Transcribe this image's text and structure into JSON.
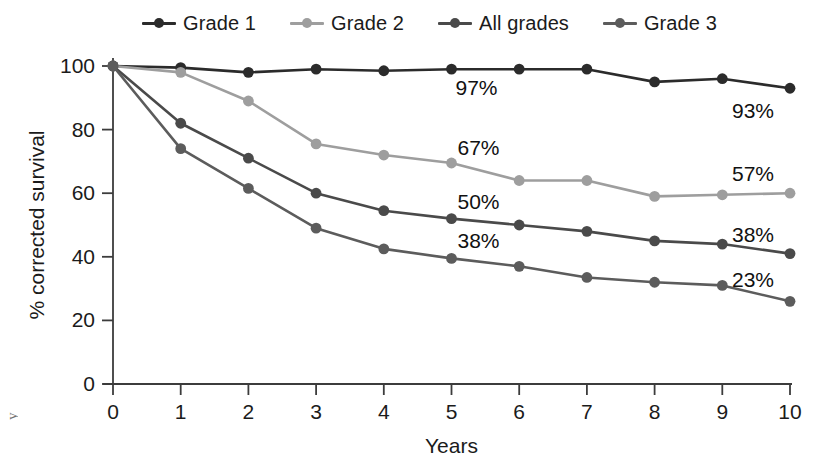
{
  "legend": {
    "position": "top",
    "items": [
      {
        "label": "Grade 1",
        "color": "#2b2b2b"
      },
      {
        "label": "Grade 2",
        "color": "#9e9e9e"
      },
      {
        "label": "All grades",
        "color": "#4a4a4a"
      },
      {
        "label": "Grade 3",
        "color": "#5c5c5c"
      }
    ]
  },
  "axes": {
    "x": {
      "label": "Years",
      "ticks": [
        "0",
        "1",
        "2",
        "3",
        "4",
        "5",
        "6",
        "7",
        "8",
        "9",
        "10"
      ]
    },
    "y": {
      "label": "% corrected survival",
      "ticks": [
        "0",
        "20",
        "40",
        "60",
        "80",
        "100"
      ]
    }
  },
  "edge_fragment": "y",
  "chart_data": {
    "type": "line",
    "title": "",
    "xlabel": "Years",
    "ylabel": "% corrected survival",
    "xlim": [
      0,
      10
    ],
    "ylim": [
      0,
      100
    ],
    "xticks": [
      0,
      1,
      2,
      3,
      4,
      5,
      6,
      7,
      8,
      9,
      10
    ],
    "yticks": [
      0,
      20,
      40,
      60,
      80,
      100
    ],
    "grid": false,
    "legend_position": "top",
    "x": [
      0,
      1,
      2,
      3,
      4,
      5,
      6,
      7,
      8,
      9,
      10
    ],
    "series": [
      {
        "name": "Grade 1",
        "color": "#2b2b2b",
        "values": [
          100,
          99.5,
          98,
          99,
          98.5,
          99,
          99,
          99,
          95,
          96,
          93
        ],
        "annotations": [
          {
            "x": 5,
            "y": 99,
            "text": "97%",
            "dx": 4,
            "dy": 26
          },
          {
            "x": 10,
            "y": 93,
            "text": "93%",
            "dx": -58,
            "dy": 30
          }
        ]
      },
      {
        "name": "Grade 2",
        "color": "#9e9e9e",
        "values": [
          100,
          98,
          89,
          75.5,
          72,
          69.5,
          64,
          64,
          59,
          59.5,
          60
        ],
        "annotations": [
          {
            "x": 5,
            "y": 69.5,
            "text": "67%",
            "dx": 6,
            "dy": -8
          },
          {
            "x": 10,
            "y": 60,
            "text": "57%",
            "dx": -58,
            "dy": -12
          }
        ]
      },
      {
        "name": "All grades",
        "color": "#4a4a4a",
        "values": [
          100,
          82,
          71,
          60,
          54.5,
          52,
          50,
          48,
          45,
          44,
          41
        ],
        "annotations": [
          {
            "x": 5,
            "y": 52,
            "text": "50%",
            "dx": 6,
            "dy": -10
          },
          {
            "x": 10,
            "y": 41,
            "text": "38%",
            "dx": -58,
            "dy": -12
          }
        ]
      },
      {
        "name": "Grade 3",
        "color": "#5c5c5c",
        "values": [
          100,
          74,
          61.5,
          49,
          42.5,
          39.5,
          37,
          33.5,
          32,
          31,
          26
        ],
        "annotations": [
          {
            "x": 5,
            "y": 39.5,
            "text": "38%",
            "dx": 6,
            "dy": -10
          },
          {
            "x": 10,
            "y": 26,
            "text": "23%",
            "dx": -58,
            "dy": -14
          }
        ]
      }
    ]
  }
}
